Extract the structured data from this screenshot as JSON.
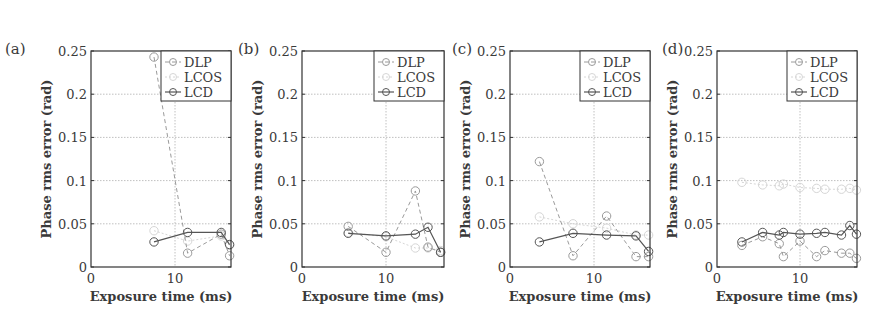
{
  "figure": {
    "ylabel": "Phase rms error (rad)",
    "xlabel": "Exposure time (ms)",
    "yticks": [
      "0",
      "0.05",
      "0.1",
      "0.15",
      "0.2",
      "0.25"
    ],
    "xticks": [
      "0",
      "10"
    ],
    "legend": [
      "DLP",
      "LCOS",
      "LCD"
    ],
    "colors": {
      "DLP": "#9a9a9a",
      "LCOS": "#d6d6d6",
      "LCD": "#555555",
      "grid": "#b0b0b0",
      "frame": "#333333"
    }
  },
  "chart_data": [
    {
      "panel": "(a)",
      "type": "line",
      "xlabel": "Exposure time (ms)",
      "ylabel": "Phase rms error (rad)",
      "ylim": [
        0,
        0.25
      ],
      "xlim": [
        0,
        16.7
      ],
      "grid": true,
      "legend_position": "upper right",
      "series": [
        {
          "name": "DLP",
          "x": [
            7.5,
            11.5,
            15.5,
            16.5
          ],
          "values": [
            0.243,
            0.016,
            0.038,
            0.013
          ]
        },
        {
          "name": "LCOS",
          "x": [
            7.5,
            11.5,
            15.5,
            16.5
          ],
          "values": [
            0.042,
            0.03,
            0.036,
            0.025
          ]
        },
        {
          "name": "LCD",
          "x": [
            7.5,
            11.5,
            15.5,
            16.5
          ],
          "values": [
            0.029,
            0.04,
            0.04,
            0.026
          ]
        }
      ]
    },
    {
      "panel": "(b)",
      "type": "line",
      "xlabel": "Exposure time (ms)",
      "ylabel": "Phase rms error (rad)",
      "ylim": [
        0,
        0.25
      ],
      "xlim": [
        0,
        16.7
      ],
      "grid": true,
      "legend_position": "upper right",
      "series": [
        {
          "name": "DLP",
          "x": [
            5.5,
            10,
            13.5,
            15,
            16.5
          ],
          "values": [
            0.047,
            0.017,
            0.088,
            0.023,
            0.017
          ]
        },
        {
          "name": "LCOS",
          "x": [
            5.5,
            10,
            13.5,
            15,
            16.5
          ],
          "values": [
            0.04,
            0.035,
            0.022,
            0.022,
            0.019
          ]
        },
        {
          "name": "LCD",
          "x": [
            5.5,
            10,
            13.5,
            15,
            16.5
          ],
          "values": [
            0.039,
            0.036,
            0.038,
            0.046,
            0.017
          ]
        }
      ]
    },
    {
      "panel": "(c)",
      "type": "line",
      "xlabel": "Exposure time (ms)",
      "ylabel": "Phase rms error (rad)",
      "ylim": [
        0,
        0.25
      ],
      "xlim": [
        0,
        16.7
      ],
      "grid": true,
      "legend_position": "upper right",
      "series": [
        {
          "name": "DLP",
          "x": [
            3.5,
            7.5,
            11.5,
            15,
            16.5
          ],
          "values": [
            0.122,
            0.013,
            0.059,
            0.012,
            0.012
          ]
        },
        {
          "name": "LCOS",
          "x": [
            3.5,
            7.5,
            11.5,
            15,
            16.5
          ],
          "values": [
            0.058,
            0.05,
            0.045,
            0.037,
            0.037
          ]
        },
        {
          "name": "LCD",
          "x": [
            3.5,
            7.5,
            11.5,
            15,
            16.5
          ],
          "values": [
            0.029,
            0.039,
            0.037,
            0.036,
            0.018
          ]
        }
      ]
    },
    {
      "panel": "(d)",
      "type": "line",
      "xlabel": "Exposure time (ms)",
      "ylabel": "Phase rms error (rad)",
      "ylim": [
        0,
        0.25
      ],
      "xlim": [
        0,
        16.9
      ],
      "grid": true,
      "legend_position": "upper right",
      "series": [
        {
          "name": "DLP",
          "x": [
            3,
            5.5,
            7.5,
            8,
            10,
            12,
            13,
            15,
            16,
            16.8
          ],
          "values": [
            0.025,
            0.035,
            0.027,
            0.012,
            0.03,
            0.012,
            0.019,
            0.016,
            0.016,
            0.01
          ]
        },
        {
          "name": "LCOS",
          "x": [
            3,
            5.5,
            7.5,
            8,
            10,
            12,
            13,
            15,
            16,
            16.8
          ],
          "values": [
            0.098,
            0.095,
            0.094,
            0.096,
            0.092,
            0.091,
            0.09,
            0.09,
            0.091,
            0.089
          ]
        },
        {
          "name": "LCD",
          "x": [
            3,
            5.5,
            7.5,
            8,
            10,
            12,
            13,
            15,
            16,
            16.8
          ],
          "values": [
            0.029,
            0.04,
            0.037,
            0.04,
            0.038,
            0.039,
            0.04,
            0.037,
            0.048,
            0.038
          ]
        }
      ]
    }
  ],
  "layout": {
    "panels": [
      {
        "label": "(a)",
        "x0": 91,
        "x1": 231,
        "pxPerMs": 8.4,
        "labelX": 5,
        "labelY": 54
      },
      {
        "label": "(b)",
        "x0": 302,
        "x1": 444,
        "pxPerMs": 8.4,
        "labelX": 238,
        "labelY": 54
      },
      {
        "label": "(c)",
        "x0": 510,
        "x1": 650,
        "pxPerMs": 8.4,
        "labelX": 452,
        "labelY": 54
      },
      {
        "label": "(d)",
        "x0": 717,
        "x1": 857,
        "pxPerMs": 8.3,
        "labelX": 662,
        "labelY": 54
      }
    ],
    "yTop": 51,
    "yBottom": 267,
    "yMax": 0.25
  }
}
